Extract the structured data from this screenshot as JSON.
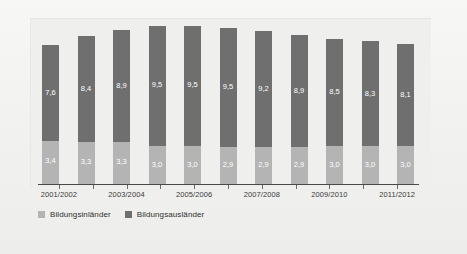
{
  "chart_data": {
    "type": "bar",
    "subtype": "stacked-bar",
    "title": "",
    "subtitle": "",
    "xlabel": "",
    "ylabel": "",
    "grid": false,
    "legend_position": "bottom-left",
    "ylim": [
      0,
      13.0
    ],
    "categories": [
      "2001/2002",
      "2002/2003",
      "2003/2004",
      "2004/2005",
      "2005/2006",
      "2006/2007",
      "2007/2008",
      "2008/2009",
      "2009/2010",
      "2010/2011",
      "2011/2012"
    ],
    "tick_labels_visible": [
      "2001/2002",
      "",
      "2003/2004",
      "",
      "2005/2006",
      "",
      "2007/2008",
      "",
      "2009/2010",
      "",
      "2011/2012"
    ],
    "series": [
      {
        "name": "Bildungsinländer",
        "color": "#b4b4b4",
        "values": [
          3.4,
          3.3,
          3.3,
          3.0,
          3.0,
          2.9,
          2.9,
          2.9,
          3.0,
          3.0,
          3.0
        ],
        "labels": [
          "3,4",
          "3,3",
          "3,3",
          "3,0",
          "3,0",
          "2,9",
          "2,9",
          "2,9",
          "3,0",
          "3,0",
          "3,0"
        ]
      },
      {
        "name": "Bildungsausländer",
        "color": "#6f6f6f",
        "values": [
          7.6,
          8.4,
          8.9,
          9.5,
          9.5,
          9.5,
          9.2,
          8.9,
          8.5,
          8.3,
          8.1
        ],
        "labels": [
          "7,6",
          "8,4",
          "8,9",
          "9,5",
          "9,5",
          "9,5",
          "9,2",
          "8,9",
          "8,5",
          "8,3",
          "8,1"
        ]
      }
    ],
    "totals": [
      11.0,
      11.7,
      12.2,
      12.5,
      12.5,
      12.4,
      12.1,
      11.8,
      11.5,
      11.3,
      11.1
    ]
  },
  "legend": {
    "items": [
      {
        "label": "Bildungsinländer",
        "color": "#b4b4b4"
      },
      {
        "label": "Bildungsausländer",
        "color": "#6f6f6f"
      }
    ]
  },
  "colors": {
    "series_light": "#b4b4b4",
    "series_dark": "#6f6f6f",
    "panel_background": "#efefed",
    "figure_background": "#f2f2f0",
    "axis": "#4a4a4a",
    "value_label": "#ffffff",
    "tick_label": "#3a3a3a"
  }
}
